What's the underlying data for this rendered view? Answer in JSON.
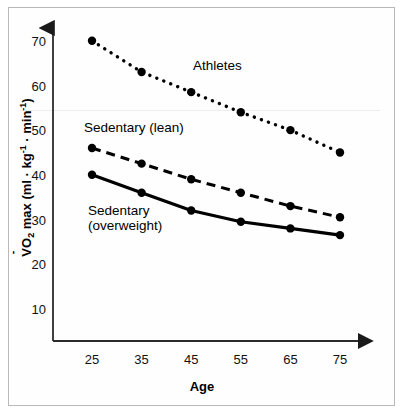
{
  "chart_data": {
    "type": "line",
    "title": "",
    "xlabel": "Age",
    "ylabel": "VO2 max (ml · kg⁻¹ · min⁻¹)",
    "categories": [
      25,
      35,
      45,
      55,
      65,
      75
    ],
    "xtick_labels": [
      "25",
      "35",
      "45",
      "55",
      "65",
      "75"
    ],
    "ytick_labels": [
      "70",
      "60",
      "50",
      "40",
      "30",
      "20",
      "10"
    ],
    "ytick_values": [
      70,
      60,
      50,
      40,
      30,
      20,
      10
    ],
    "xlim": [
      20,
      80
    ],
    "ylim": [
      5,
      73
    ],
    "grid": false,
    "legend": "inline-annotations",
    "series": [
      {
        "name": "Athletes",
        "style": "dotted",
        "color": "#000000",
        "values": [
          70.5,
          63.5,
          59.0,
          54.5,
          50.5,
          45.5
        ]
      },
      {
        "name": "Sedentary (lean)",
        "style": "dashed",
        "color": "#000000",
        "values": [
          46.5,
          43.0,
          39.5,
          36.5,
          33.5,
          31.0
        ]
      },
      {
        "name": "Sedentary (overweight)",
        "style": "solid",
        "color": "#000000",
        "values": [
          40.5,
          36.5,
          32.5,
          30.0,
          28.5,
          27.0
        ]
      }
    ],
    "annotations": [
      {
        "text": "Athletes",
        "series": "Athletes"
      },
      {
        "text": "Sedentary (lean)",
        "series": "Sedentary (lean)"
      },
      {
        "text_line1": "Sedentary",
        "text_line2": "(overweight)",
        "series": "Sedentary (overweight)"
      }
    ]
  },
  "axis": {
    "y_prefix": "O",
    "y_sub": "2",
    "y_mid": " max (ml · kg",
    "y_sup1": "-1",
    "y_mid2": " · min",
    "y_sup2": "-1",
    "y_close": ")",
    "x_title": "Age"
  }
}
